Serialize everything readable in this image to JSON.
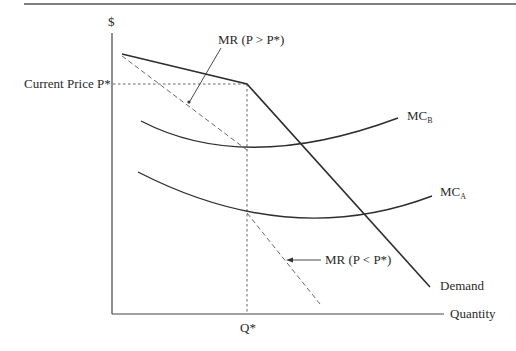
{
  "diagram": {
    "type": "economics-kinked-demand",
    "y_axis_label": "$",
    "x_axis_label": "Quantity",
    "price_label": "Current Price P*",
    "quantity_label": "Q*",
    "curves": {
      "demand": {
        "label": "Demand"
      },
      "mr_upper": {
        "label": "MR (P > P*)"
      },
      "mr_lower": {
        "label": "MR (P < P*)"
      },
      "mc_b": {
        "label": "MC",
        "subscript": "B"
      },
      "mc_a": {
        "label": "MC",
        "subscript": "A"
      }
    },
    "colors": {
      "line": "#2e2e2e",
      "dashed": "#6a6a6a",
      "text": "#2a2a2a"
    }
  }
}
